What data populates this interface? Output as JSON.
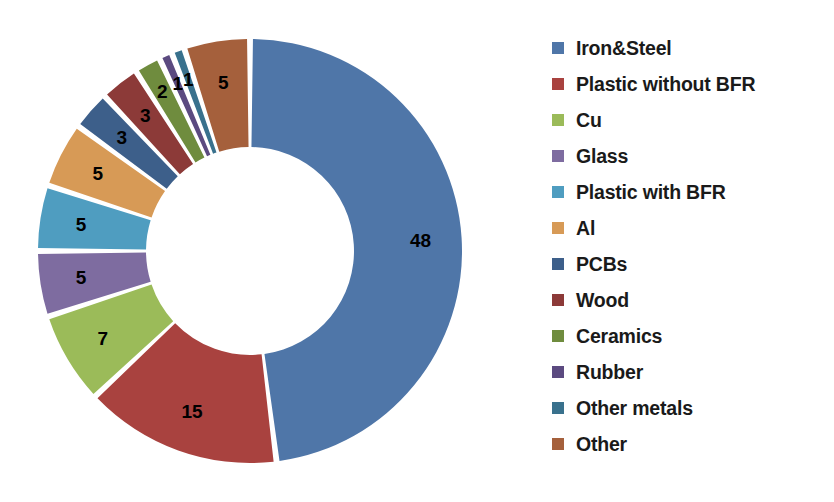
{
  "chart_data": {
    "type": "pie",
    "variant": "doughnut",
    "title": "",
    "subtitle": "",
    "xlabel": "",
    "ylabel": "",
    "legend_position": "right",
    "grid": false,
    "units": "percent",
    "total": 100,
    "labels_shown": true,
    "categories": [
      "Iron&Steel",
      "Plastic without BFR",
      "Cu",
      "Glass",
      "Plastic with BFR",
      "Al",
      "PCBs",
      "Wood",
      "Ceramics",
      "Rubber",
      "Other metals",
      "Other"
    ],
    "values": [
      48,
      15,
      7,
      5,
      5,
      5,
      3,
      3,
      2,
      1,
      1,
      5
    ],
    "colors": [
      "#4f76a8",
      "#a9423f",
      "#9bbb59",
      "#7e6ca0",
      "#4f9dc0",
      "#d79a56",
      "#3d5f8a",
      "#8c3a38",
      "#6f8c3e",
      "#5b4a80",
      "#39718d",
      "#a5603c"
    ],
    "data_labels": [
      "48",
      "15",
      "7",
      "5",
      "5",
      "5",
      "3",
      "3",
      "2",
      "1",
      "1",
      "5"
    ],
    "slices": [
      {
        "label": "Iron&Steel",
        "value": 48,
        "data_label": "48",
        "color": "#4f76a8"
      },
      {
        "label": "Plastic without BFR",
        "value": 15,
        "data_label": "15",
        "color": "#a9423f"
      },
      {
        "label": "Cu",
        "value": 7,
        "data_label": "7",
        "color": "#9bbb59"
      },
      {
        "label": "Glass",
        "value": 5,
        "data_label": "5",
        "color": "#7e6ca0"
      },
      {
        "label": "Plastic with BFR",
        "value": 5,
        "data_label": "5",
        "color": "#4f9dc0"
      },
      {
        "label": "Al",
        "value": 5,
        "data_label": "5",
        "color": "#d79a56"
      },
      {
        "label": "PCBs",
        "value": 3,
        "data_label": "3",
        "color": "#3d5f8a"
      },
      {
        "label": "Wood",
        "value": 3,
        "data_label": "3",
        "color": "#8c3a38"
      },
      {
        "label": "Ceramics",
        "value": 2,
        "data_label": "2",
        "color": "#6f8c3e"
      },
      {
        "label": "Rubber",
        "value": 1,
        "data_label": "1",
        "color": "#5b4a80"
      },
      {
        "label": "Other metals",
        "value": 1,
        "data_label": "1",
        "color": "#39718d"
      },
      {
        "label": "Other",
        "value": 5,
        "data_label": "5",
        "color": "#a5603c"
      }
    ]
  },
  "legend": {
    "items": [
      {
        "label": "Iron&Steel",
        "color": "#4f76a8"
      },
      {
        "label": "Plastic without BFR",
        "color": "#a9423f"
      },
      {
        "label": "Cu",
        "color": "#9bbb59"
      },
      {
        "label": "Glass",
        "color": "#7e6ca0"
      },
      {
        "label": "Plastic with BFR",
        "color": "#4f9dc0"
      },
      {
        "label": "Al",
        "color": "#d79a56"
      },
      {
        "label": "PCBs",
        "color": "#3d5f8a"
      },
      {
        "label": "Wood",
        "color": "#8c3a38"
      },
      {
        "label": "Ceramics",
        "color": "#6f8c3e"
      },
      {
        "label": "Rubber",
        "color": "#5b4a80"
      },
      {
        "label": "Other metals",
        "color": "#39718d"
      },
      {
        "label": "Other",
        "color": "#a5603c"
      }
    ]
  }
}
